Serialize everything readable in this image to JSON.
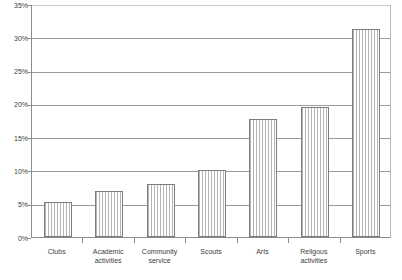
{
  "chart_data": {
    "type": "bar",
    "title": "",
    "subtitle": "",
    "xlabel": "",
    "ylabel": "",
    "categories": [
      "Clubs",
      "Academic activities",
      "Community service",
      "Scouts",
      "Arts",
      "Religous activities",
      "Sports"
    ],
    "category_lines": [
      [
        "Clubs"
      ],
      [
        "Academic",
        "activities"
      ],
      [
        "Community",
        "service"
      ],
      [
        "Scouts"
      ],
      [
        "Arts"
      ],
      [
        "Religous",
        "activities"
      ],
      [
        "Sports"
      ]
    ],
    "values": [
      5.3,
      6.9,
      8.0,
      10.0,
      17.7,
      19.6,
      31.2
    ],
    "value_labels": [
      "",
      "",
      "",
      "",
      "",
      "",
      ""
    ],
    "ylim": [
      0,
      35
    ],
    "ytick_values": [
      0,
      5,
      10,
      15,
      20,
      25,
      30,
      35
    ],
    "ytick_labels": [
      "0%",
      "5%",
      "10%",
      "15%",
      "20%",
      "25%",
      "30%",
      "35%"
    ],
    "grid": true,
    "legend": false,
    "legend_position": "none",
    "bar_fill": "vertical-stripe-hatch",
    "colors": {
      "bar_stripe": "#b4b4b4",
      "bar_background": "#ffffff",
      "bar_outline": "#7d7d7d",
      "gridline": "#9a9a9a",
      "axis": "#8c8c8c",
      "text": "#3d3d3d",
      "plot_background": "#ffffff"
    }
  }
}
